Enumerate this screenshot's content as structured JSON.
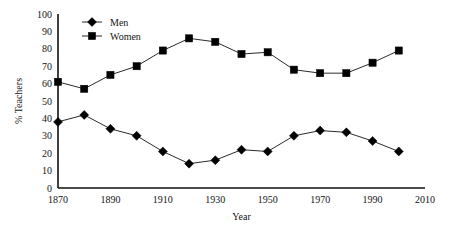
{
  "chart_data": {
    "type": "line",
    "title": "",
    "xlabel": "Year",
    "ylabel": "% Teachers",
    "xlim": [
      1870,
      2010
    ],
    "ylim": [
      0,
      100
    ],
    "grid": false,
    "legend_position": "top-left-inside",
    "x_tick_labels": [
      "1870",
      "1890",
      "1910",
      "1930",
      "1950",
      "1970",
      "1990",
      "2010"
    ],
    "x_tick_values": [
      1870,
      1890,
      1910,
      1930,
      1950,
      1970,
      1990,
      2010
    ],
    "y_tick_labels": [
      "0",
      "10",
      "20",
      "30",
      "40",
      "50",
      "60",
      "70",
      "80",
      "90",
      "100"
    ],
    "y_tick_values": [
      0,
      10,
      20,
      30,
      40,
      50,
      60,
      70,
      80,
      90,
      100
    ],
    "x": [
      1870,
      1880,
      1890,
      1900,
      1910,
      1920,
      1930,
      1940,
      1950,
      1960,
      1970,
      1980,
      1990,
      2000
    ],
    "series": [
      {
        "name": "Men",
        "marker": "diamond",
        "color": "#000000",
        "values": [
          38,
          42,
          34,
          30,
          21,
          14,
          16,
          22,
          21,
          30,
          33,
          32,
          27,
          21
        ]
      },
      {
        "name": "Women",
        "marker": "square",
        "color": "#000000",
        "values": [
          61,
          57,
          65,
          70,
          79,
          86,
          84,
          77,
          78,
          68,
          66,
          66,
          72,
          79
        ]
      }
    ]
  }
}
